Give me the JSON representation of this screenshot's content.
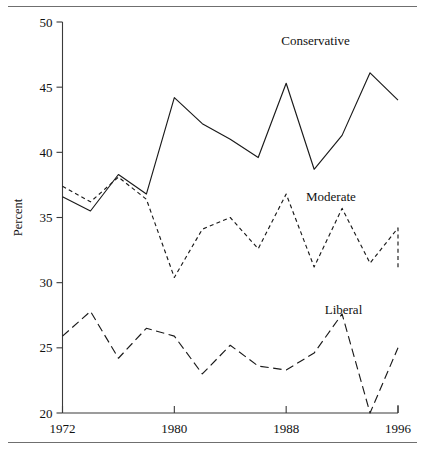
{
  "figure": {
    "has_top_rule": true,
    "has_bottom_rule": true,
    "rule_color": "#6f6f6f"
  },
  "chart_data": {
    "type": "line",
    "title": "",
    "xlabel": "",
    "ylabel": "Percent",
    "xlim": [
      1972,
      1996
    ],
    "ylim": [
      20,
      50
    ],
    "ytick_labels": [
      "50",
      "45",
      "40",
      "35",
      "30",
      "25",
      "20"
    ],
    "yticks": [
      50,
      45,
      40,
      35,
      30,
      25,
      20
    ],
    "xtick_labels": [
      "1972",
      "1980",
      "1988",
      "1996"
    ],
    "xticks": [
      1972,
      1980,
      1988,
      1996
    ],
    "grid": false,
    "legend_position": "inline-right",
    "x": [
      1972,
      1974,
      1976,
      1978,
      1980,
      1982,
      1984,
      1986,
      1988,
      1990,
      1992,
      1994,
      1996
    ],
    "series": [
      {
        "name": "Conservative",
        "style": "solid",
        "color": "#1a1a1a",
        "label_x": 1990.1,
        "label_y": 48.2,
        "values": [
          36.6,
          35.5,
          38.3,
          36.8,
          44.2,
          42.2,
          41.0,
          39.6,
          45.3,
          38.7,
          41.3,
          46.1,
          44.0
        ]
      },
      {
        "name": "Moderate",
        "style": "short-dash",
        "color": "#1a1a1a",
        "label_x": 1991.2,
        "label_y": 36.3,
        "values": [
          37.4,
          36.2,
          38.1,
          36.4,
          30.4,
          34.1,
          35.0,
          32.6,
          36.8,
          31.2,
          35.7,
          31.5,
          34.2
        ]
      },
      {
        "name": "Liberal",
        "style": "long-dash",
        "color": "#1a1a1a",
        "label_x": 1992.1,
        "label_y": 27.6,
        "values": [
          25.9,
          27.8,
          24.2,
          26.5,
          25.9,
          23.0,
          25.2,
          23.6,
          23.3,
          24.6,
          27.6,
          20.0,
          25.0
        ]
      }
    ],
    "series_last_extra": {
      "Moderate": 31.1
    }
  }
}
